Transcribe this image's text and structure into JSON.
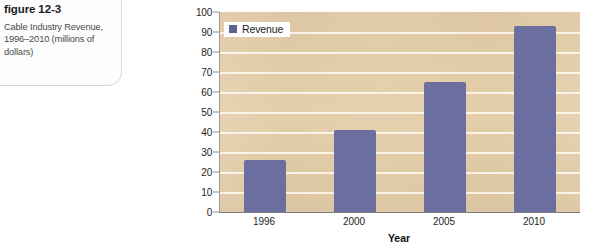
{
  "figure": {
    "heading_word": "figure",
    "heading_number": "12-3",
    "caption": "Cable Industry Revenue, 1996–2010 (millions of dollars)"
  },
  "legend": {
    "label": "Revenue",
    "swatch_color": "#5d6296"
  },
  "axes": {
    "x_title": "Year",
    "y_ticks": [
      "100",
      "90",
      "80",
      "70",
      "60",
      "50",
      "40",
      "30",
      "20",
      "10",
      "0"
    ],
    "x_ticks": [
      "1996",
      "2000",
      "2005",
      "2010"
    ]
  },
  "colors": {
    "bar": "#6a6fa0",
    "plot_background": "#e3cba6",
    "gridline": "#fbf4ea",
    "panel_background": "#fdfdfd"
  },
  "chart_data": {
    "type": "bar",
    "title": "Cable Industry Revenue, 1996–2010 (millions of dollars)",
    "categories": [
      "1996",
      "2000",
      "2005",
      "2010"
    ],
    "values": [
      26,
      41,
      65,
      93
    ],
    "series": [
      {
        "name": "Revenue",
        "values": [
          26,
          41,
          65,
          93
        ]
      }
    ],
    "xlabel": "Year",
    "ylabel": "",
    "ylim": [
      0,
      100
    ],
    "ytick_step": 10,
    "grid": true,
    "legend_position": "top-left"
  }
}
